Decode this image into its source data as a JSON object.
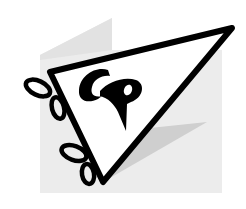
{
  "logo": {
    "monogram": "CP",
    "shape": "pennant-flag",
    "colors": {
      "background": "#ffffff",
      "backdrop": "#ebebeb",
      "backdrop_dark": "#d6d6d6",
      "shadow": "#c9c9c9",
      "ink": "#000000",
      "pennant_fill": "#ffffff"
    }
  }
}
